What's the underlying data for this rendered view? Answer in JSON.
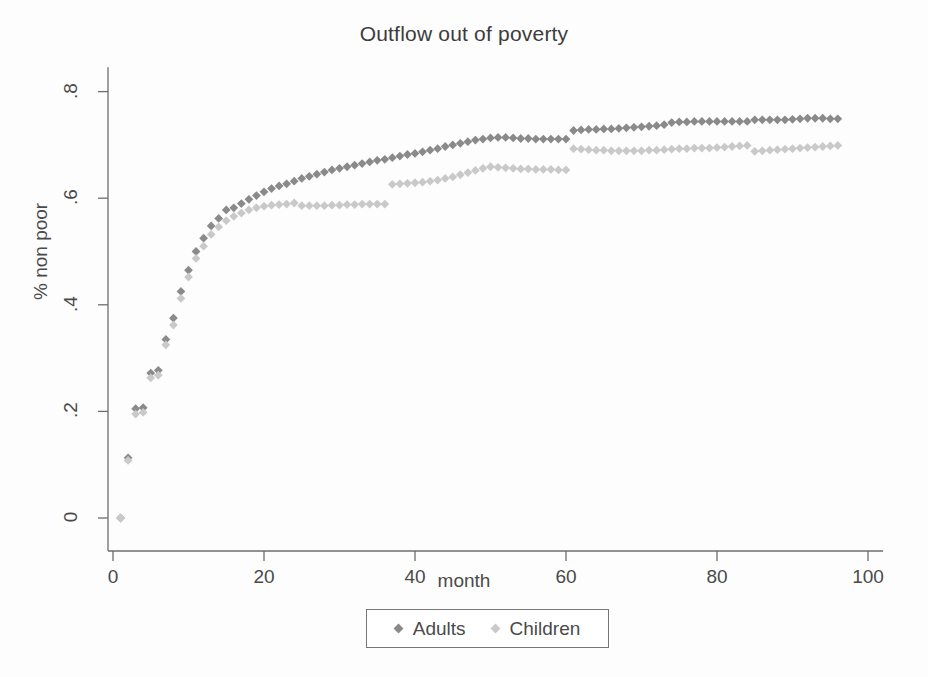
{
  "chart_data": {
    "type": "scatter",
    "title": "Outflow out of poverty",
    "xlabel": "month",
    "ylabel": "% non poor",
    "xlim": [
      -2,
      102
    ],
    "ylim": [
      -0.03,
      0.84
    ],
    "xticks": [
      0,
      20,
      40,
      60,
      80,
      100
    ],
    "xtick_labels": [
      "0",
      "20",
      "40",
      "60",
      "80",
      "100"
    ],
    "yticks": [
      0,
      0.2,
      0.4,
      0.6,
      0.8
    ],
    "ytick_labels": [
      "0",
      ".2",
      ".4",
      ".6",
      ".8"
    ],
    "grid": false,
    "legend_position": "bottom",
    "marker": "diamond",
    "series": [
      {
        "name": "Adults",
        "color": "#8a8a8a",
        "x": [
          1,
          2,
          3,
          4,
          5,
          6,
          7,
          8,
          9,
          10,
          11,
          12,
          13,
          14,
          15,
          16,
          17,
          18,
          19,
          20,
          21,
          22,
          23,
          24,
          25,
          26,
          27,
          28,
          29,
          30,
          31,
          32,
          33,
          34,
          35,
          36,
          37,
          38,
          39,
          40,
          41,
          42,
          43,
          44,
          45,
          46,
          47,
          48,
          49,
          50,
          51,
          52,
          53,
          54,
          55,
          56,
          57,
          58,
          59,
          60,
          61,
          62,
          63,
          64,
          65,
          66,
          67,
          68,
          69,
          70,
          71,
          72,
          73,
          74,
          75,
          76,
          77,
          78,
          79,
          80,
          81,
          82,
          83,
          84,
          85,
          86,
          87,
          88,
          89,
          90,
          91,
          92,
          93,
          94,
          95,
          96
        ],
        "y": [
          0.0,
          0.113,
          0.205,
          0.207,
          0.272,
          0.277,
          0.335,
          0.375,
          0.425,
          0.465,
          0.5,
          0.525,
          0.548,
          0.562,
          0.578,
          0.582,
          0.59,
          0.598,
          0.605,
          0.612,
          0.618,
          0.623,
          0.627,
          0.632,
          0.637,
          0.641,
          0.645,
          0.649,
          0.653,
          0.656,
          0.659,
          0.662,
          0.665,
          0.668,
          0.671,
          0.673,
          0.676,
          0.679,
          0.682,
          0.684,
          0.687,
          0.69,
          0.693,
          0.697,
          0.7,
          0.703,
          0.706,
          0.709,
          0.711,
          0.713,
          0.714,
          0.714,
          0.713,
          0.712,
          0.712,
          0.711,
          0.711,
          0.711,
          0.711,
          0.711,
          0.727,
          0.728,
          0.729,
          0.729,
          0.73,
          0.73,
          0.731,
          0.732,
          0.733,
          0.734,
          0.735,
          0.736,
          0.738,
          0.742,
          0.743,
          0.743,
          0.744,
          0.744,
          0.744,
          0.744,
          0.744,
          0.744,
          0.744,
          0.744,
          0.747,
          0.747,
          0.747,
          0.747,
          0.747,
          0.748,
          0.749,
          0.75,
          0.75,
          0.75,
          0.749,
          0.749
        ]
      },
      {
        "name": "Children",
        "color": "#c9c9c9",
        "x": [
          1,
          2,
          3,
          4,
          5,
          6,
          7,
          8,
          9,
          10,
          11,
          12,
          13,
          14,
          15,
          16,
          17,
          18,
          19,
          20,
          21,
          22,
          23,
          24,
          25,
          26,
          27,
          28,
          29,
          30,
          31,
          32,
          33,
          34,
          35,
          36,
          37,
          38,
          39,
          40,
          41,
          42,
          43,
          44,
          45,
          46,
          47,
          48,
          49,
          50,
          51,
          52,
          53,
          54,
          55,
          56,
          57,
          58,
          59,
          60,
          61,
          62,
          63,
          64,
          65,
          66,
          67,
          68,
          69,
          70,
          71,
          72,
          73,
          74,
          75,
          76,
          77,
          78,
          79,
          80,
          81,
          82,
          83,
          84,
          85,
          86,
          87,
          88,
          89,
          90,
          91,
          92,
          93,
          94,
          95,
          96
        ],
        "y": [
          0.0,
          0.108,
          0.195,
          0.198,
          0.263,
          0.268,
          0.325,
          0.362,
          0.412,
          0.452,
          0.487,
          0.51,
          0.532,
          0.546,
          0.558,
          0.566,
          0.572,
          0.578,
          0.582,
          0.585,
          0.587,
          0.588,
          0.589,
          0.591,
          0.586,
          0.586,
          0.586,
          0.586,
          0.587,
          0.587,
          0.588,
          0.588,
          0.589,
          0.589,
          0.589,
          0.589,
          0.626,
          0.627,
          0.628,
          0.629,
          0.63,
          0.632,
          0.634,
          0.637,
          0.64,
          0.644,
          0.648,
          0.652,
          0.656,
          0.659,
          0.658,
          0.657,
          0.656,
          0.655,
          0.655,
          0.654,
          0.654,
          0.654,
          0.653,
          0.653,
          0.693,
          0.692,
          0.691,
          0.69,
          0.69,
          0.689,
          0.689,
          0.689,
          0.689,
          0.689,
          0.69,
          0.69,
          0.691,
          0.692,
          0.693,
          0.693,
          0.694,
          0.694,
          0.694,
          0.695,
          0.696,
          0.697,
          0.698,
          0.699,
          0.688,
          0.689,
          0.69,
          0.691,
          0.692,
          0.693,
          0.694,
          0.695,
          0.696,
          0.697,
          0.698,
          0.699
        ]
      }
    ]
  },
  "legend": {
    "items": [
      {
        "label": "Adults",
        "color": "#8a8a8a"
      },
      {
        "label": "Children",
        "color": "#c9c9c9"
      }
    ]
  }
}
